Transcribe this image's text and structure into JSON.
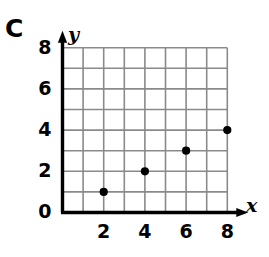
{
  "part_label": "C",
  "chart_data": {
    "type": "scatter",
    "title": "",
    "xlabel": "x",
    "ylabel": "y",
    "xlim": [
      0,
      8
    ],
    "ylim": [
      0,
      8
    ],
    "grid": true,
    "grid_step": 1,
    "legend": "none",
    "x_tick_labels": [
      "2",
      "4",
      "6",
      "8"
    ],
    "x_tick_values": [
      2,
      4,
      6,
      8
    ],
    "y_tick_labels": [
      "2",
      "4",
      "6",
      "8"
    ],
    "y_tick_values": [
      2,
      4,
      6,
      8
    ],
    "origin_label": "0",
    "points": [
      {
        "x": 2,
        "y": 1
      },
      {
        "x": 4,
        "y": 2
      },
      {
        "x": 6,
        "y": 3
      },
      {
        "x": 8,
        "y": 4
      }
    ],
    "point_color": "#000000",
    "axis_color": "#000000",
    "grid_color": "#8a8a8a"
  }
}
